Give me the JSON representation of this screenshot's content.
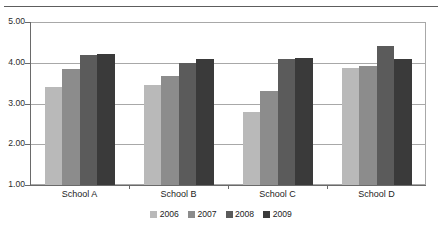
{
  "chart_data": {
    "type": "bar",
    "title": "",
    "xlabel": "",
    "ylabel": "",
    "ylim": [
      1.0,
      5.0
    ],
    "yticks": [
      "1.00",
      "2.00",
      "3.00",
      "4.00",
      "5.00"
    ],
    "ytick_values": [
      1.0,
      2.0,
      3.0,
      4.0,
      5.0
    ],
    "grid": true,
    "legend_position": "bottom",
    "categories": [
      "School A",
      "School B",
      "School C",
      "School D"
    ],
    "series": [
      {
        "name": "2006",
        "color": "#b9b9b9",
        "values": [
          3.4,
          3.45,
          2.8,
          3.88
        ]
      },
      {
        "name": "2007",
        "color": "#8c8c8c",
        "values": [
          3.85,
          3.68,
          3.3,
          3.92
        ]
      },
      {
        "name": "2008",
        "color": "#5b5b5b",
        "values": [
          4.2,
          4.0,
          4.1,
          4.4
        ]
      },
      {
        "name": "2009",
        "color": "#3a3a3a",
        "values": [
          4.22,
          4.1,
          4.12,
          4.1
        ]
      }
    ]
  },
  "legend": {
    "items": [
      {
        "label": "2006"
      },
      {
        "label": "2007"
      },
      {
        "label": "2008"
      },
      {
        "label": "2009"
      }
    ]
  }
}
